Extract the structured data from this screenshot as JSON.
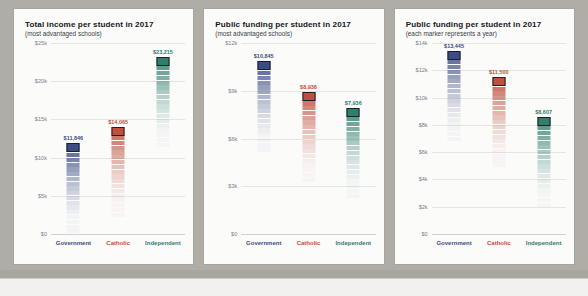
{
  "background_colors": {
    "outer": "#b0ada7",
    "panel": "#fbfbfa",
    "bottom_strip": "#f2f1ef"
  },
  "series_colors": {
    "Government": "#3b4c86",
    "Catholic": "#c0503c",
    "Independent": "#2f7f6c"
  },
  "chart_data": [
    {
      "type": "bar",
      "title": "Total income per student in 2017",
      "subtitle": "(most advantaged schools)",
      "xlabel": "",
      "ylabel": "",
      "ylim": [
        0,
        25000
      ],
      "yticks": [
        0,
        5000,
        10000,
        15000,
        20000,
        25000
      ],
      "ytick_labels": [
        "$0",
        "$5k",
        "$10k",
        "$15k",
        "$20k",
        "$25k"
      ],
      "grid": true,
      "legend": "none",
      "categories": [
        "Government",
        "Catholic",
        "Independent"
      ],
      "values": [
        11846,
        14065,
        23215
      ],
      "value_labels": [
        "$11,846",
        "$14,065",
        "$23,215"
      ]
    },
    {
      "type": "bar",
      "title": "Public funding per student in 2017",
      "subtitle": "(most advantaged schools)",
      "xlabel": "",
      "ylabel": "",
      "ylim": [
        0,
        12000
      ],
      "yticks": [
        0,
        3000,
        6000,
        9000,
        12000
      ],
      "ytick_labels": [
        "$0",
        "$3k",
        "$6k",
        "$9k",
        "$12k"
      ],
      "grid": true,
      "legend": "none",
      "categories": [
        "Government",
        "Catholic",
        "Independent"
      ],
      "values": [
        10845,
        8938,
        7936
      ],
      "value_labels": [
        "$10,845",
        "$8,938",
        "$7,936"
      ]
    },
    {
      "type": "bar",
      "title": "Public funding per student in 2017",
      "subtitle": "(each marker represents a year)",
      "xlabel": "",
      "ylabel": "",
      "ylim": [
        0,
        14000
      ],
      "yticks": [
        0,
        2000,
        4000,
        6000,
        8000,
        10000,
        12000,
        14000
      ],
      "ytick_labels": [
        "$0",
        "$2k",
        "$4k",
        "$6k",
        "$8k",
        "$10k",
        "$12k",
        "$14k"
      ],
      "grid": true,
      "legend": "none",
      "categories": [
        "Government",
        "Catholic",
        "Independent"
      ],
      "values": [
        13445,
        11500,
        8607
      ],
      "value_labels": [
        "$13,445",
        "$11,500",
        "$8,607"
      ]
    }
  ]
}
